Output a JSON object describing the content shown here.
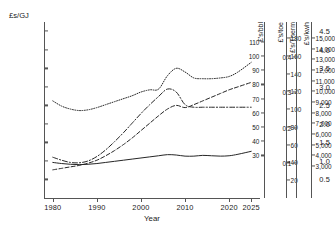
{
  "chart_data": {
    "type": "line",
    "title": "",
    "xlabel": "Year",
    "ylabel": "£s/GJ",
    "xlim": [
      1978,
      2027
    ],
    "ylim": [
      0,
      4.75
    ],
    "grid": false,
    "legend": "none",
    "x_ticks": [
      1980,
      1990,
      2000,
      2010,
      2020,
      2025
    ],
    "x_tick_labels": [
      "1980",
      "1990",
      "2000",
      "2010",
      "2020",
      "2025"
    ],
    "y_ticks": [
      0.5,
      1.0,
      1.5,
      2.0,
      2.5,
      3.0,
      3.5,
      4.0,
      4.5
    ],
    "y_tick_labels": [
      "0.5",
      "1.0",
      "1.5",
      "2.0",
      "2.5",
      "3.0",
      "3.5",
      "4.0",
      "4.5"
    ],
    "secondary_axes": [
      {
        "label": "£'s/bbl",
        "ticks": [
          30,
          40,
          50,
          60,
          70,
          80,
          90,
          100,
          110
        ],
        "tick_labels": [
          "30",
          "40",
          "50",
          "60",
          "70",
          "80",
          "90",
          "100",
          "110"
        ],
        "range": [
          0,
          124
        ]
      },
      {
        "label": "£'s/toe",
        "ticks": [
          20,
          40,
          60,
          80,
          100,
          120,
          140,
          160,
          180
        ],
        "tick_labels": [
          "20",
          "40",
          "60",
          "80",
          "100",
          "120",
          "140",
          "160",
          "180"
        ],
        "range": [
          0,
          198
        ]
      },
      {
        "label": "£'s/Therm",
        "ticks": [
          0.1,
          0.2,
          0.3,
          0.4
        ],
        "tick_labels": [
          "0.1",
          "0.2",
          "0.3",
          "0.4"
        ],
        "range": [
          0,
          0.5
        ]
      },
      {
        "label": "£'s/kwh",
        "ticks": [
          3000,
          4000,
          5000,
          6000,
          7000,
          8000,
          9000,
          10000,
          11000,
          12000,
          13000,
          14000,
          15000
        ],
        "tick_labels": [
          "3,000",
          "4,000",
          "5,000",
          "6,000",
          "7,000",
          "8,000",
          "9,000",
          "10,000",
          "11,000",
          "12,000",
          "13,000",
          "14,000",
          "15,000"
        ],
        "range": [
          0,
          16500
        ]
      }
    ],
    "x": [
      1980,
      1982,
      1984,
      1986,
      1988,
      1990,
      1992,
      1994,
      1996,
      1998,
      2000,
      2002,
      2004,
      2006,
      2008,
      2010,
      2012,
      2014,
      2016,
      2018,
      2020,
      2022,
      2025
    ],
    "series": [
      {
        "name": "series-dotted",
        "style": "dotted",
        "values": [
          2.62,
          2.48,
          2.4,
          2.36,
          2.38,
          2.44,
          2.52,
          2.6,
          2.68,
          2.76,
          2.86,
          2.92,
          2.94,
          3.3,
          3.5,
          3.4,
          3.24,
          3.22,
          3.22,
          3.24,
          3.28,
          3.4,
          3.66
        ]
      },
      {
        "name": "series-dash-dot",
        "style": "dash-dot",
        "values": [
          1.1,
          1.02,
          0.96,
          0.95,
          1.0,
          1.12,
          1.3,
          1.52,
          1.76,
          2.02,
          2.28,
          2.52,
          2.74,
          2.94,
          2.86,
          2.52,
          2.45,
          2.45,
          2.45,
          2.45,
          2.45,
          2.45,
          2.45
        ]
      },
      {
        "name": "series-dashed",
        "style": "dashed",
        "values": [
          0.76,
          0.8,
          0.84,
          0.88,
          0.94,
          1.02,
          1.14,
          1.28,
          1.44,
          1.62,
          1.82,
          2.02,
          2.22,
          2.4,
          2.5,
          2.44,
          2.52,
          2.62,
          2.72,
          2.82,
          2.92,
          3.0,
          3.12
        ]
      },
      {
        "name": "series-solid",
        "style": "solid",
        "values": [
          0.96,
          0.93,
          0.91,
          0.9,
          0.91,
          0.93,
          0.96,
          0.99,
          1.02,
          1.05,
          1.08,
          1.11,
          1.14,
          1.17,
          1.16,
          1.13,
          1.13,
          1.15,
          1.14,
          1.13,
          1.14,
          1.18,
          1.26
        ]
      }
    ]
  }
}
